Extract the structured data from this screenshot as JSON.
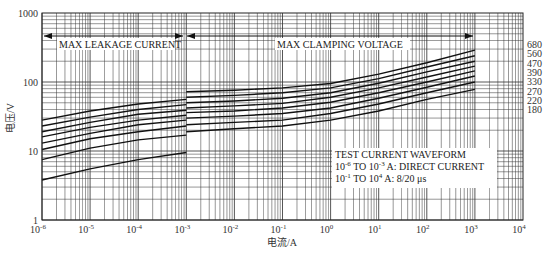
{
  "chart_data": {
    "type": "line",
    "title": "",
    "xlabel": "电流/A",
    "ylabel": "电压/V",
    "xscale": "log",
    "yscale": "log",
    "xlim": [
      1e-06,
      10000.0
    ],
    "ylim": [
      1,
      1000
    ],
    "x_ticks": [
      "10^-6",
      "10^-5",
      "10^-4",
      "10^-3",
      "10^-2",
      "10^-1",
      "10^0",
      "10^1",
      "10^2",
      "10^3",
      "10^4"
    ],
    "y_ticks": [
      "1",
      "10",
      "100",
      "1000"
    ],
    "grid": true,
    "regions": [
      {
        "label": "MAX LEAKAGE CURRENT",
        "x_range": [
          1e-06,
          0.001
        ]
      },
      {
        "label": "MAX CLAMPING VOLTAGE",
        "x_range": [
          0.001,
          1000.0
        ]
      }
    ],
    "annotation": {
      "title": "TEST CURRENT WAVEFORM",
      "line1_prefix": "10",
      "line1_exp1": "-6",
      "line1_mid": " TO 10",
      "line1_exp2": "-3",
      "line1_suffix": " A:  DIRECT CURRENT",
      "line2_prefix": "10",
      "line2_exp1": "-1",
      "line2_mid": " TO 10",
      "line2_exp2": "4",
      "line2_suffix": " A:  8/20 μs"
    },
    "legend_position": "right",
    "x": [
      1e-06,
      1e-05,
      0.0001,
      0.001,
      0.001,
      0.01,
      0.1,
      1.0,
      10.0,
      100.0,
      1000.0
    ],
    "series": [
      {
        "name": "680",
        "values": [
          28,
          38,
          48,
          56,
          72,
          76,
          82,
          95,
          130,
          190,
          290
        ]
      },
      {
        "name": "560",
        "values": [
          23,
          31,
          40,
          47,
          60,
          64,
          70,
          82,
          112,
          165,
          240
        ]
      },
      {
        "name": "470",
        "values": [
          19,
          26,
          34,
          39,
          50,
          53,
          58,
          70,
          96,
          140,
          200
        ]
      },
      {
        "name": "390",
        "values": [
          16,
          22,
          28,
          33,
          42,
          45,
          49,
          60,
          82,
          118,
          170
        ]
      },
      {
        "name": "330",
        "values": [
          13,
          18,
          24,
          28,
          36,
          38,
          42,
          51,
          70,
          100,
          145
        ]
      },
      {
        "name": "270",
        "values": [
          10.5,
          15,
          19,
          23,
          30,
          32,
          35,
          42,
          58,
          84,
          122
        ]
      },
      {
        "name": "220",
        "values": [
          7.5,
          11,
          14.5,
          17,
          24,
          26,
          28,
          35,
          48,
          70,
          100
        ]
      },
      {
        "name": "180",
        "values": [
          3.8,
          5.5,
          7.5,
          9.5,
          19,
          21,
          23,
          28,
          38,
          56,
          78
        ]
      }
    ]
  },
  "axis": {
    "y_label": "电压/V",
    "x_label": "电流/A",
    "y_ticks": [
      "1000",
      "100",
      "10",
      "1"
    ],
    "x_tick_base": "10",
    "x_tick_exps": [
      "-6",
      "-5",
      "-4",
      "-3",
      "-2",
      "-1",
      "0",
      "1",
      "2",
      "3",
      "4"
    ]
  },
  "legend": [
    "680",
    "560",
    "470",
    "390",
    "330",
    "270",
    "220",
    "180"
  ],
  "regions": {
    "leakage": "MAX LEAKAGE CURRENT",
    "clamping": "MAX CLAMPING VOLTAGE"
  },
  "annotation": {
    "title": "TEST CURRENT WAVEFORM",
    "line1": {
      "a": "10",
      "e1": "-6",
      "b": " TO 10",
      "e2": "-3",
      "c": " A:  DIRECT CURRENT"
    },
    "line2": {
      "a": "10",
      "e1": "-1",
      "b": " TO 10",
      "e2": "4",
      "c": " A:  8/20 μs"
    }
  },
  "colors": {
    "grid": "#3a3a3a",
    "curve": "#111111",
    "text": "#333333"
  }
}
